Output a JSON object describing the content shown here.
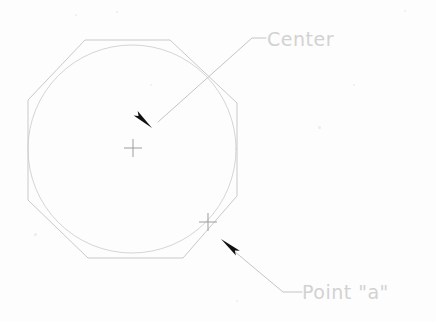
{
  "drawing": {
    "title": "Circle inscribed in octagon with center and point a callouts",
    "background_color": "#fdfdfd",
    "line_color": "#c9c9c9",
    "circle_color": "#d5d5d5",
    "leader_color": "#c4c4c4",
    "arrow_color": "#111111",
    "text_color": "#d2d2d2",
    "octagon": {
      "name": "octagon-outline",
      "points": "85,40 170,40 237,103 237,196 183,258 88,258 28,200 28,100",
      "stroke_width": 1
    },
    "circle": {
      "name": "inscribed-circle",
      "cx": 132,
      "cy": 149,
      "r": 104,
      "stroke_width": 1
    },
    "markers": [
      {
        "name": "center-crosshair",
        "label": "Center",
        "x": 133,
        "y": 148,
        "size": 9
      },
      {
        "name": "point-a-crosshair",
        "label": "Point \"a\"",
        "x": 208,
        "y": 222,
        "size": 9
      }
    ],
    "callouts": [
      {
        "name": "center-callout",
        "text": "Center",
        "leader_path": "M 266,38 L 252,38 L 158,122",
        "arrow_tip_x": 152,
        "arrow_tip_y": 128,
        "arrow_angle": 222,
        "text_x": 267,
        "text_y": 46,
        "font_size": 19
      },
      {
        "name": "point-a-callout",
        "text": "Point \"a\"",
        "leader_path": "M 302,292 L 283,292 L 228,246",
        "arrow_tip_x": 221,
        "arrow_tip_y": 239,
        "arrow_angle": 40,
        "text_x": 302,
        "text_y": 299,
        "font_size": 19
      }
    ],
    "specks": [
      {
        "x": 34,
        "y": 233,
        "d": 3
      },
      {
        "x": 318,
        "y": 126,
        "d": 3
      },
      {
        "x": 150,
        "y": 84,
        "d": 2
      },
      {
        "x": 75,
        "y": 14,
        "d": 2
      },
      {
        "x": 404,
        "y": 10,
        "d": 2
      },
      {
        "x": 236,
        "y": 300,
        "d": 2
      },
      {
        "x": 116,
        "y": 11,
        "d": 2
      },
      {
        "x": 353,
        "y": 84,
        "d": 2
      }
    ]
  }
}
